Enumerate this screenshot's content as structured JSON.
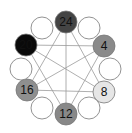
{
  "diagram": {
    "title": "",
    "ring_center": [
      66,
      66
    ],
    "ring_radius": 50,
    "circle_radius": 11,
    "nodes": [
      {
        "id": "n0",
        "x": 66,
        "y": 22,
        "label": "24",
        "fill": "#444444"
      },
      {
        "id": "n1",
        "x": 89,
        "y": 28,
        "label": "",
        "fill": "#ffffff"
      },
      {
        "id": "n2",
        "x": 104,
        "y": 46,
        "label": "4",
        "fill": "#8a8a8a"
      },
      {
        "id": "n3",
        "x": 110,
        "y": 69,
        "label": "",
        "fill": "#ffffff"
      },
      {
        "id": "n4",
        "x": 104,
        "y": 92,
        "label": "8",
        "fill": "#e6e6e6"
      },
      {
        "id": "n5",
        "x": 89,
        "y": 108,
        "label": "",
        "fill": "#ffffff"
      },
      {
        "id": "n6",
        "x": 66,
        "y": 114,
        "label": "12",
        "fill": "#888888"
      },
      {
        "id": "n7",
        "x": 42,
        "y": 108,
        "label": "",
        "fill": "#ffffff"
      },
      {
        "id": "n8",
        "x": 27,
        "y": 90,
        "label": "16",
        "fill": "#8f8f8f"
      },
      {
        "id": "n9",
        "x": 21,
        "y": 69,
        "label": "",
        "fill": "#ffffff"
      },
      {
        "id": "n10",
        "x": 26,
        "y": 45,
        "label": "20",
        "fill": "#0a0a0a"
      },
      {
        "id": "n11",
        "x": 42,
        "y": 28,
        "label": "",
        "fill": "#ffffff"
      }
    ],
    "edges": [
      [
        "n0",
        "n4"
      ],
      [
        "n0",
        "n8"
      ],
      [
        "n0",
        "n6"
      ],
      [
        "n2",
        "n6"
      ],
      [
        "n2",
        "n10"
      ],
      [
        "n2",
        "n8"
      ],
      [
        "n4",
        "n8"
      ],
      [
        "n4",
        "n10"
      ],
      [
        "n6",
        "n10"
      ]
    ]
  }
}
